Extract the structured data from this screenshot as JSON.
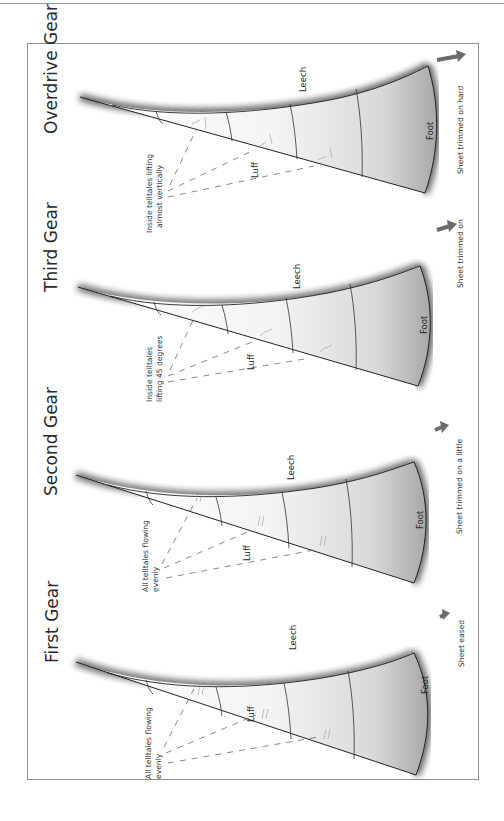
{
  "diagram": {
    "orientation": "rotated 90deg (text reads bottom-to-top)",
    "colors": {
      "frame": "#8f8f8f",
      "line": "#222222",
      "sail_shadow": "#1a1a1a",
      "arrow": "#6b6b6b",
      "dash": "#555555"
    },
    "panels": [
      {
        "title": "Overdrive Gear",
        "labels": {
          "leech": "Leech",
          "luff": "Luff",
          "foot": "Foot"
        },
        "note_line1": "Inside telltales lifting",
        "note_line2": "almost vertically",
        "sheet": "Sheet trimmed on hard"
      },
      {
        "title": "Third Gear",
        "labels": {
          "leech": "Leech",
          "luff": "Luff",
          "foot": "Foot"
        },
        "note_line1": "Inside telltales",
        "note_line2": "lifting 45 degrees",
        "sheet": "Sheet trimmed on"
      },
      {
        "title": "Second Gear",
        "labels": {
          "leech": "Leech",
          "luff": "Luff",
          "foot": "Foot"
        },
        "note_line1": "All telltales flowing",
        "note_line2": "evenly",
        "sheet": "Sheet trimmed on a little"
      },
      {
        "title": "First Gear",
        "labels": {
          "leech": "Leech",
          "luff": "Luff",
          "foot": "Foot"
        },
        "note_line1": "All telltales flowing",
        "note_line2": "evenly",
        "sheet": "Sheet eased"
      }
    ]
  }
}
